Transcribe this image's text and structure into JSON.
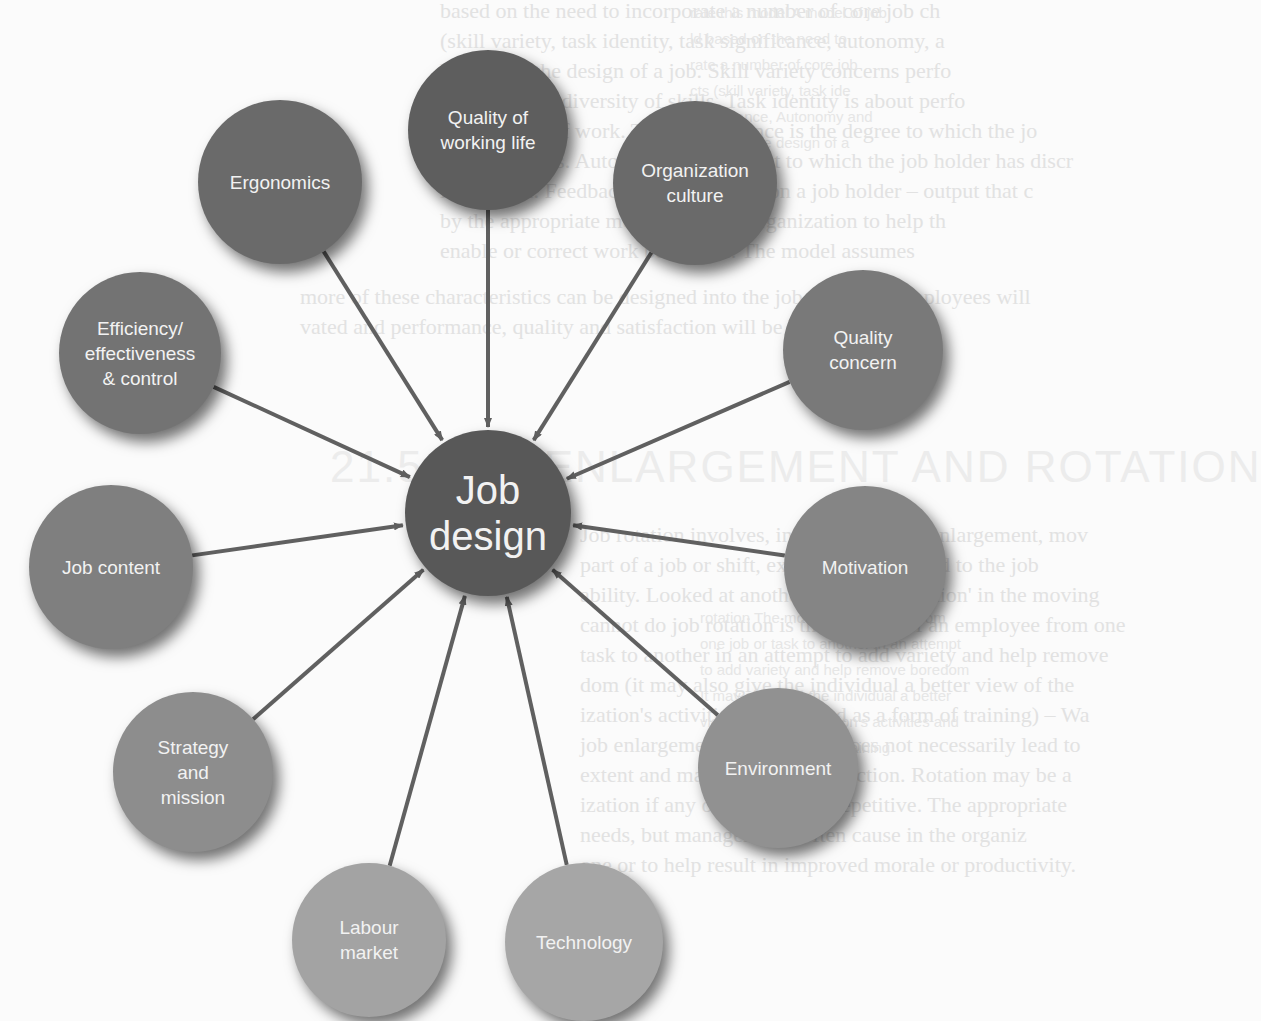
{
  "diagram": {
    "center": {
      "label": "Job\ndesign",
      "color": "#585858",
      "x": 488,
      "y": 513,
      "r": 83
    },
    "nodes": [
      {
        "id": "quality-of-working-life",
        "label": "Quality of\nworking life",
        "color": "#5e5e5e",
        "x": 488,
        "y": 130,
        "r": 80
      },
      {
        "id": "ergonomics",
        "label": "Ergonomics",
        "color": "#6a6a6a",
        "x": 280,
        "y": 182,
        "r": 82
      },
      {
        "id": "organization-culture",
        "label": "Organization\nculture",
        "color": "#6a6a6a",
        "x": 695,
        "y": 183,
        "r": 82
      },
      {
        "id": "efficiency-effectiveness-control",
        "label": "Efficiency/\neffectiveness\n& control",
        "color": "#737373",
        "x": 140,
        "y": 353,
        "r": 81
      },
      {
        "id": "quality-concern",
        "label": "Quality\nconcern",
        "color": "#797979",
        "x": 863,
        "y": 350,
        "r": 80
      },
      {
        "id": "job-content",
        "label": "Job content",
        "color": "#7f7f7f",
        "x": 111,
        "y": 567,
        "r": 82
      },
      {
        "id": "motivation",
        "label": "Motivation",
        "color": "#858585",
        "x": 865,
        "y": 567,
        "r": 81
      },
      {
        "id": "strategy-and-mission",
        "label": "Strategy\nand\nmission",
        "color": "#8d8d8d",
        "x": 193,
        "y": 772,
        "r": 80
      },
      {
        "id": "environment",
        "label": "Environment",
        "color": "#919191",
        "x": 778,
        "y": 768,
        "r": 80
      },
      {
        "id": "labour-market",
        "label": "Labour\nmarket",
        "color": "#a3a3a3",
        "x": 369,
        "y": 940,
        "r": 77
      },
      {
        "id": "technology",
        "label": "Technology",
        "color": "#a6a6a6",
        "x": 584,
        "y": 942,
        "r": 79
      }
    ],
    "arrow_color": "#606060"
  },
  "background_text": {
    "main_lines": [
      "based on the need to incorporate a number of core job ch",
      "(skill variety, task identity, task significance, autonomy, a",
      "back) into the design of a job. Skill variety concerns perfo",
      "that require a diversity of skills. Task identity is about perfo",
      "whole piece of work. Task significance is the degree to which the jo",
      "lives of others. Autonomy is the extent to which the job holder has discr",
      "is freedom. Feedback is the information a job holder – output that c",
      "by the appropriate members of the organization to help th",
      "enable or correct work behaviour. The model assumes",
      "more of these characteristics can be designed into the job, the more employees will",
      "vated and performance, quality and satisfaction will be higher."
    ],
    "side_lines_top": [
      "rate this model A model of job",
      "ld based on the need to",
      "rate a number of core job",
      "cts (skill variety, task ide",
      "significance, Autonomy and",
      "ack) into the design of a"
    ],
    "heading": "21.5 JOB ENLARGEMENT AND ROTATION",
    "lower_lines": [
      "Job rotation involves, in contrast to job enlargement, mov",
      "part of a job or shift, extra tasks are added to the job",
      "ability. Looked at another way, it is 'rotation' in the moving",
      "cannot do job rotation is the moving of an employee from one",
      "task to another in an attempt to add variety and help remove",
      "dom (it may also give the individual a better view of the",
      "ization's activities and be used as a form of training) – Wa",
      "job enlargement. Such a step does not necessarily lead to",
      "extent and may cause dissatisfaction. Rotation may be a",
      "ization if any one task is too repetitive. The appropriate",
      "needs, but managements often cause in the organiz",
      "one or to help result in improved morale or productivity."
    ],
    "side_lines_bottom": [
      "rotation The moving of a person from",
      "one job or task to another in an attempt",
      "to add variety and help remove boredom",
      "It may also give the individual a better",
      "view of the organization's activities and",
      "be used as a form of training"
    ]
  }
}
